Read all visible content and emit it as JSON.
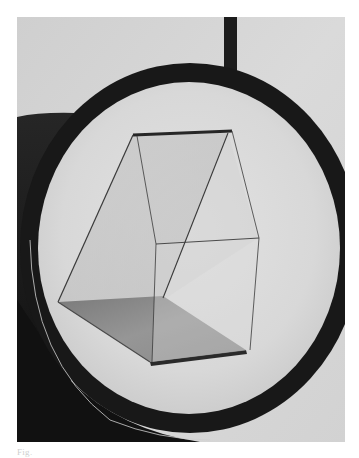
{
  "figure": {
    "palette": {
      "background_wall": "#d4d4d4",
      "mirror_face": "#dcdcdc",
      "ring_frame": "#1a1a1a",
      "shadow": "#141414",
      "prism_base": "#8a8a8a",
      "prism_edge": "#3a3a3a"
    },
    "caption": "Fig."
  }
}
